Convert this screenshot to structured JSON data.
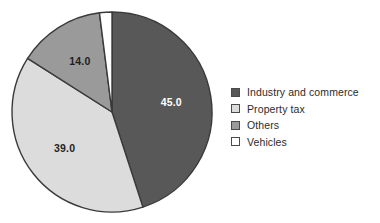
{
  "chart_data": {
    "type": "pie",
    "title": "",
    "subtitle": "",
    "xlabel": "",
    "ylabel": "",
    "legend_position": "right",
    "grid": false,
    "start_angle_deg": 0,
    "direction": "clockwise",
    "categories": [
      "Industry and commerce",
      "Property tax",
      "Others",
      "Vehicles"
    ],
    "values": [
      45.0,
      39.0,
      14.0,
      2.0
    ],
    "value_labels": [
      "45.0",
      "39.0",
      "14.0",
      ""
    ],
    "colors": [
      "#585858",
      "#dcdcdc",
      "#9a9a9a",
      "#ffffff"
    ],
    "label_text_colors": [
      "#ffffff",
      "#1f1f1f",
      "#1f1f1f",
      "#1f1f1f"
    ],
    "slice_outline_color": "#3a3a3a",
    "total": 100.0
  },
  "legend": {
    "items": [
      {
        "label": "Industry and commerce",
        "color": "#585858"
      },
      {
        "label": "Property tax",
        "color": "#dcdcdc"
      },
      {
        "label": "Others",
        "color": "#9a9a9a"
      },
      {
        "label": "Vehicles",
        "color": "#ffffff"
      }
    ]
  },
  "geometry": {
    "center_x": 112,
    "center_y": 112,
    "radius": 100
  }
}
